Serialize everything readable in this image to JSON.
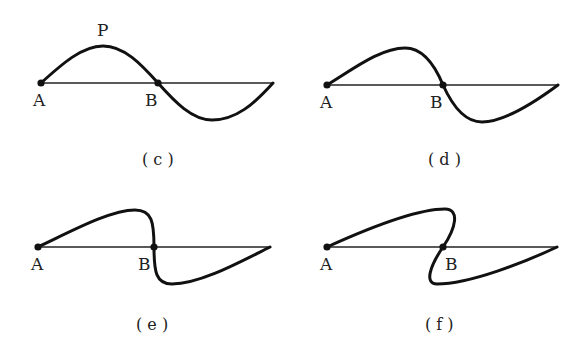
{
  "figure": {
    "panels": [
      {
        "id": "c",
        "caption": "( c )",
        "labels": {
          "start": "A",
          "node": "B",
          "peak": "P"
        }
      },
      {
        "id": "d",
        "caption": "( d )",
        "labels": {
          "start": "A",
          "node": "B"
        }
      },
      {
        "id": "e",
        "caption": "( e )",
        "labels": {
          "start": "A",
          "node": "B"
        }
      },
      {
        "id": "f",
        "caption": "( f )",
        "labels": {
          "start": "A",
          "node": "B"
        }
      }
    ]
  },
  "colors": {
    "stroke": "#111111",
    "background": "#ffffff"
  }
}
